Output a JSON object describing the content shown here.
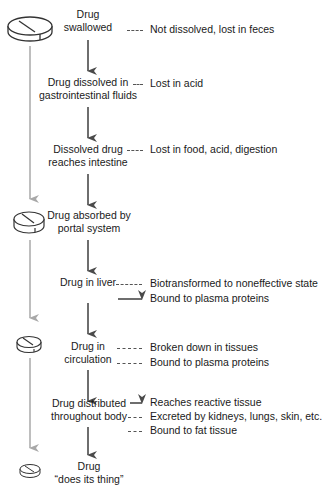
{
  "diagram": {
    "type": "flowchart",
    "colors": {
      "main_arrow": "#4a4a4a",
      "side_arrow": "#a8a8a8",
      "text": "#1a1a1a"
    },
    "steps": [
      {
        "label1": "Drug",
        "label2": "swallowed"
      },
      {
        "label1": "Drug dissolved in",
        "label2": "gastrointestinal fluids"
      },
      {
        "label1": "Dissolved drug",
        "label2": "reaches intestine"
      },
      {
        "label1": "Drug absorbed by",
        "label2": "portal system"
      },
      {
        "label1": "Drug in liver",
        "label2": ""
      },
      {
        "label1": "Drug in",
        "label2": "circulation"
      },
      {
        "label1": "Drug distributed",
        "label2": "throughout body"
      },
      {
        "label1": "Drug",
        "label2": "“does its thing”"
      }
    ],
    "outcomes": {
      "swallowed": [
        "Not dissolved, lost in feces"
      ],
      "dissolved": [
        "Lost in acid"
      ],
      "intestine": [
        "Lost in food, acid, digestion"
      ],
      "liver": [
        "Biotransformed to noneffective state",
        "Bound to plasma proteins"
      ],
      "circulation": [
        "Broken down in tissues",
        "Bound to plasma proteins"
      ],
      "distributed": [
        "Reaches reactive tissue",
        "Excreted by kidneys, lungs, skin, etc.",
        "Bound to fat tissue"
      ]
    },
    "icons": [
      "pill-icon",
      "pill-icon",
      "pill-icon",
      "pill-icon"
    ]
  }
}
